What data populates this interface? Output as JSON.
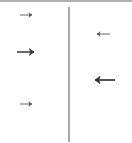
{
  "figure": {
    "title": "",
    "width": 132,
    "height": 143,
    "background_color": "#ffffff",
    "top_border_color": "#b0b0b0"
  },
  "divider": {
    "name": "vertical-divider-line",
    "orientation": "vertical",
    "x": 69,
    "y_start": 5,
    "y_end": 140,
    "color": "#6f6f6f",
    "stroke_width": 1.2
  },
  "chart_data": {
    "type": "diagram",
    "title": "",
    "xlabel": "",
    "ylabel": "",
    "axis_ranges": {
      "x": [
        0,
        132
      ],
      "y": [
        0,
        143
      ]
    },
    "grid": false,
    "legend": null,
    "annotations": [],
    "groups": [
      {
        "name": "left-arrows",
        "side": "left",
        "direction": "right",
        "count": 3
      },
      {
        "name": "right-arrows",
        "side": "right",
        "direction": "left",
        "count": 2
      }
    ],
    "arrows": [
      {
        "id": "left-arrow-1",
        "side": "left",
        "direction": "right",
        "x_tail": 20,
        "x_head": 32,
        "y": 13,
        "length": 12,
        "stroke_width": 0.9,
        "head_size": 3.2,
        "color": "#555555"
      },
      {
        "id": "left-arrow-2",
        "side": "left",
        "direction": "right",
        "x_tail": 17,
        "x_head": 34,
        "y": 50,
        "length": 17,
        "stroke_width": 1.5,
        "head_size": 4.6,
        "color": "#3a3a3a"
      },
      {
        "id": "left-arrow-3",
        "side": "left",
        "direction": "right",
        "x_tail": 20,
        "x_head": 32,
        "y": 102,
        "length": 12,
        "stroke_width": 0.9,
        "head_size": 3.2,
        "color": "#555555"
      },
      {
        "id": "right-arrow-1",
        "side": "right",
        "direction": "left",
        "x_tail": 110,
        "x_head": 97,
        "y": 32,
        "length": 13,
        "stroke_width": 0.9,
        "head_size": 3.2,
        "color": "#555555"
      },
      {
        "id": "right-arrow-2",
        "side": "right",
        "direction": "left",
        "x_tail": 115,
        "x_head": 95,
        "y": 78,
        "length": 20,
        "stroke_width": 1.7,
        "head_size": 5.0,
        "color": "#333333"
      }
    ]
  }
}
